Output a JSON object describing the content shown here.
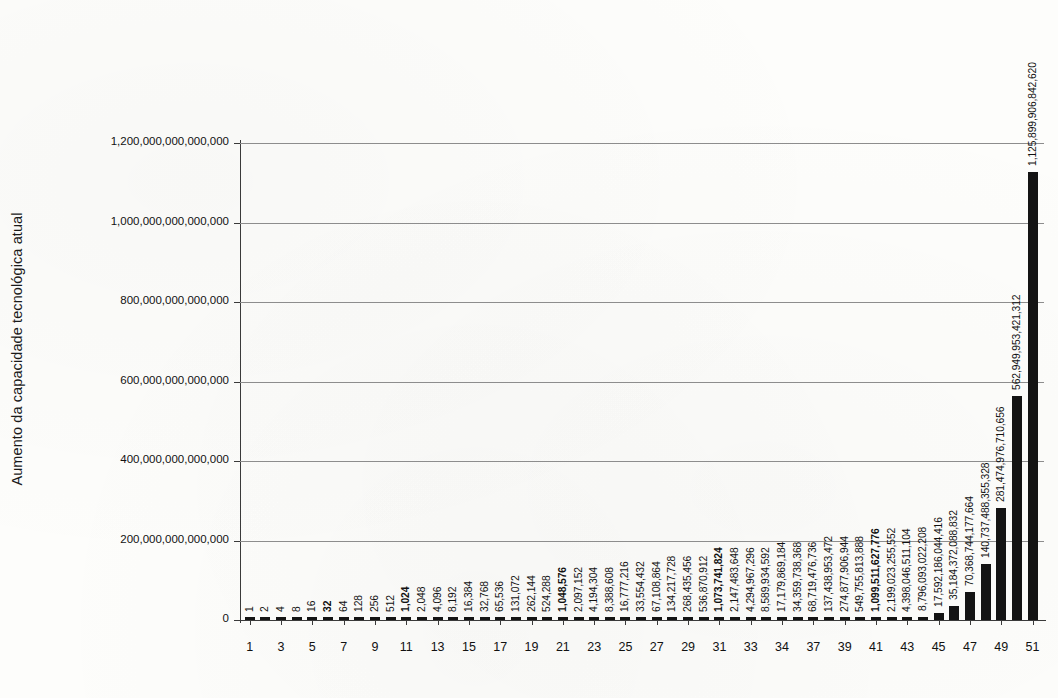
{
  "chart_data": {
    "type": "bar",
    "title": "",
    "subtitle": "",
    "xlabel": "",
    "ylabel": "Aumento da capacidade tecnológica atual",
    "ylim": [
      0,
      1200000000000000
    ],
    "ytick_values": [
      0,
      200000000000000,
      400000000000000,
      600000000000000,
      800000000000000,
      1000000000000000,
      1200000000000000
    ],
    "ytick_labels": [
      "0",
      "200,000,000,000,000",
      "400,000,000,000,000",
      "600,000,000,000,000",
      "800,000,000,000,000",
      "1,000,000,000,000,000",
      "1,200,000,000,000,000"
    ],
    "grid": true,
    "legend": false,
    "x": [
      1,
      2,
      3,
      4,
      5,
      6,
      7,
      8,
      9,
      10,
      11,
      12,
      13,
      14,
      15,
      16,
      17,
      18,
      19,
      20,
      21,
      22,
      23,
      24,
      25,
      26,
      27,
      28,
      29,
      30,
      31,
      32,
      33,
      34,
      35,
      36,
      37,
      38,
      39,
      40,
      41,
      42,
      43,
      44,
      45,
      46,
      47,
      48,
      49,
      50,
      51
    ],
    "xtick_positions": [
      1,
      3,
      5,
      7,
      9,
      11,
      13,
      15,
      17,
      19,
      21,
      23,
      25,
      27,
      29,
      31,
      33,
      35,
      37,
      39,
      41,
      43,
      45,
      47,
      49,
      51
    ],
    "xtick_labels": [
      "1",
      "3",
      "5",
      "7",
      "9",
      "11",
      "13",
      "15",
      "17",
      "19",
      "21",
      "23",
      "25",
      "27",
      "29",
      "31",
      "33",
      "34",
      "37",
      "39",
      "41",
      "43",
      "45",
      "47",
      "49",
      "51"
    ],
    "values": [
      1,
      2,
      4,
      8,
      16,
      32,
      64,
      128,
      256,
      512,
      1024,
      2048,
      4096,
      8192,
      16384,
      32768,
      65536,
      131072,
      262144,
      524288,
      1048576,
      2097152,
      4194304,
      8388608,
      16777216,
      33554432,
      67108864,
      134217728,
      268435456,
      536870912,
      1073741824,
      2147483648,
      4294967296,
      8589934592,
      17179869184,
      34359738368,
      68719476736,
      137438953472,
      274877906944,
      549755813888,
      1099511627776,
      2199023255552,
      4398046511104,
      8796093022208,
      17592186044416,
      35184372088832,
      70368744177664,
      140737488355328,
      281474976710656,
      562949953421312,
      1125899906842620
    ],
    "value_labels": [
      "1",
      "2",
      "4",
      "8",
      "16",
      "32",
      "64",
      "128",
      "256",
      "512",
      "1,024",
      "2,048",
      "4,096",
      "8,192",
      "16,384",
      "32,768",
      "65,536",
      "131,072",
      "262,144",
      "524,288",
      "1,048,576",
      "2,097,152",
      "4,194,304",
      "8,388,608",
      "16,777,216",
      "33,554,432",
      "67,108,864",
      "134,217,728",
      "268,435,456",
      "536,870,912",
      "1,073,741,824",
      "2,147,483,648",
      "4,294,967,296",
      "8,589,934,592",
      "17,179,869,184",
      "34,359,738,368",
      "68,719,476,736",
      "137,438,953,472",
      "274,877,906,944",
      "549,755,813,888",
      "1,099,511,627,776",
      "2,199,023,255,552",
      "4,398,046,511,104",
      "8,796,093,022,208",
      "17,592,186,044,416",
      "35,184,372,088,832",
      "70,368,744,177,664",
      "140,737,488,355,328",
      "281,474,976,710,656",
      "562,949,953,421,312",
      "1,125,899,906,842,620"
    ],
    "bold_label_indices": [
      5,
      10,
      20,
      30,
      40
    ],
    "bar_color": "#141414",
    "grid_color": "#8d8d8d",
    "axis_color": "#3a3a3a",
    "background_color": "#fdfdfb"
  }
}
